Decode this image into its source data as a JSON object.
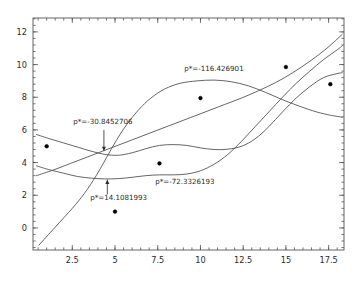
{
  "figure": {
    "background_color": "#ffffff",
    "frame_color": "#555555",
    "curve_color": "#4a4a4a",
    "point_color": "#000000",
    "text_color": "#2b2b2b"
  },
  "chart_data": {
    "type": "scatter",
    "title": "",
    "xlabel": "",
    "ylabel": "",
    "xlim": [
      0.2,
      18.4
    ],
    "ylim": [
      -1.35,
      12.85
    ],
    "grid": false,
    "legend": "none",
    "frame": true,
    "tick_direction": "in",
    "xticks_major": [
      2.5,
      5,
      12.5,
      15,
      17.5
    ],
    "xtick_labels": [
      "2.5",
      "5",
      "7.5",
      "10",
      "12.5",
      "15",
      "17.5"
    ],
    "xtick_values": [
      2.5,
      5,
      7.5,
      10,
      12.5,
      15,
      17.5
    ],
    "yticks_major": [
      0,
      2,
      4,
      6,
      8,
      10,
      12
    ],
    "ytick_labels": [
      "0",
      "2",
      "4",
      "6",
      "8",
      "10",
      "12"
    ],
    "xminor_step": 0.5,
    "yminor_step": 0.4,
    "points": [
      {
        "x": 1.0,
        "y": 5.0
      },
      {
        "x": 5.0,
        "y": 1.0
      },
      {
        "x": 7.6,
        "y": 3.95
      },
      {
        "x": 10.0,
        "y": 7.95
      },
      {
        "x": 15.0,
        "y": 9.85
      },
      {
        "x": 17.6,
        "y": 8.8
      }
    ],
    "series": [
      {
        "name": "curve-sigmoid",
        "label": "p*=-116.426901",
        "kind": "line",
        "points": [
          [
            0.55,
            -1.05
          ],
          [
            1.5,
            0.05
          ],
          [
            2.5,
            1.2
          ],
          [
            3.2,
            2.1
          ],
          [
            3.9,
            3.2
          ],
          [
            4.5,
            4.3
          ],
          [
            5.1,
            5.4
          ],
          [
            5.7,
            6.35
          ],
          [
            6.4,
            7.25
          ],
          [
            7.1,
            7.95
          ],
          [
            7.9,
            8.5
          ],
          [
            8.8,
            8.85
          ],
          [
            9.8,
            9.0
          ],
          [
            10.8,
            9.05
          ],
          [
            11.8,
            8.95
          ],
          [
            12.8,
            8.7
          ],
          [
            13.8,
            8.3
          ],
          [
            14.8,
            7.85
          ],
          [
            15.8,
            7.45
          ],
          [
            16.8,
            7.1
          ],
          [
            17.6,
            6.9
          ],
          [
            18.3,
            6.78
          ]
        ]
      },
      {
        "name": "curve-shallow-decline",
        "label": "p*=-30.8452706",
        "kind": "line",
        "points": [
          [
            0.4,
            5.72
          ],
          [
            1.2,
            5.45
          ],
          [
            2.0,
            5.2
          ],
          [
            2.8,
            4.95
          ],
          [
            3.6,
            4.7
          ],
          [
            4.4,
            4.5
          ],
          [
            5.2,
            4.45
          ],
          [
            6.0,
            4.6
          ],
          [
            6.8,
            4.85
          ],
          [
            7.6,
            5.05
          ],
          [
            8.4,
            5.1
          ],
          [
            9.2,
            5.05
          ],
          [
            10.0,
            4.9
          ],
          [
            10.8,
            4.8
          ],
          [
            11.6,
            4.82
          ],
          [
            12.4,
            5.0
          ],
          [
            13.2,
            5.45
          ],
          [
            14.0,
            6.2
          ],
          [
            14.8,
            7.1
          ],
          [
            15.6,
            7.95
          ],
          [
            16.4,
            8.65
          ],
          [
            17.2,
            9.2
          ],
          [
            18.0,
            9.45
          ],
          [
            18.3,
            9.5
          ]
        ]
      },
      {
        "name": "curve-wavy-dip",
        "label": "p*=-72.3326193",
        "kind": "line",
        "points": [
          [
            0.4,
            3.8
          ],
          [
            1.2,
            3.55
          ],
          [
            2.0,
            3.35
          ],
          [
            2.8,
            3.15
          ],
          [
            3.6,
            3.05
          ],
          [
            4.4,
            3.0
          ],
          [
            5.2,
            3.02
          ],
          [
            6.0,
            3.1
          ],
          [
            6.8,
            3.2
          ],
          [
            7.6,
            3.25
          ],
          [
            8.4,
            3.25
          ],
          [
            9.2,
            3.3
          ],
          [
            10.0,
            3.5
          ],
          [
            10.8,
            3.9
          ],
          [
            11.6,
            4.5
          ],
          [
            12.4,
            5.3
          ],
          [
            13.2,
            6.2
          ],
          [
            14.0,
            7.1
          ],
          [
            14.8,
            8.0
          ],
          [
            15.6,
            8.85
          ],
          [
            16.4,
            9.6
          ],
          [
            17.2,
            10.3
          ],
          [
            18.0,
            10.9
          ],
          [
            18.3,
            11.15
          ]
        ]
      },
      {
        "name": "curve-steep-line",
        "label": "p*=14.1081993",
        "kind": "line",
        "points": [
          [
            0.4,
            3.2
          ],
          [
            1.4,
            3.55
          ],
          [
            2.4,
            3.95
          ],
          [
            3.4,
            4.35
          ],
          [
            4.4,
            4.75
          ],
          [
            5.4,
            5.15
          ],
          [
            6.4,
            5.55
          ],
          [
            7.4,
            5.95
          ],
          [
            8.4,
            6.35
          ],
          [
            9.4,
            6.75
          ],
          [
            10.4,
            7.15
          ],
          [
            11.4,
            7.55
          ],
          [
            12.4,
            7.95
          ],
          [
            13.4,
            8.4
          ],
          [
            14.4,
            8.9
          ],
          [
            15.4,
            9.5
          ],
          [
            16.4,
            10.2
          ],
          [
            17.4,
            11.0
          ],
          [
            18.3,
            11.85
          ]
        ]
      }
    ],
    "annotations": [
      {
        "id": "annot-116",
        "text": "p*=-116.426901",
        "text_x": 9.05,
        "text_y": 9.6,
        "anchor": "start",
        "arrow": false
      },
      {
        "id": "annot-30",
        "text": "p*=-30.8452706",
        "text_x": 2.55,
        "text_y": 6.35,
        "anchor": "start",
        "arrow": true,
        "arrow_from_x": 4.35,
        "arrow_from_y": 6.0,
        "arrow_to_x": 4.35,
        "arrow_to_y": 4.72
      },
      {
        "id": "annot-72",
        "text": "p*=-72.3326193",
        "text_x": 7.35,
        "text_y": 2.72,
        "anchor": "start",
        "arrow": false
      },
      {
        "id": "annot-14",
        "text": "p*=14.1081993",
        "text_x": 3.55,
        "text_y": 1.72,
        "anchor": "start",
        "arrow": true,
        "arrow_from_x": 4.55,
        "arrow_from_y": 2.05,
        "arrow_to_x": 4.55,
        "arrow_to_y": 2.95
      }
    ]
  }
}
